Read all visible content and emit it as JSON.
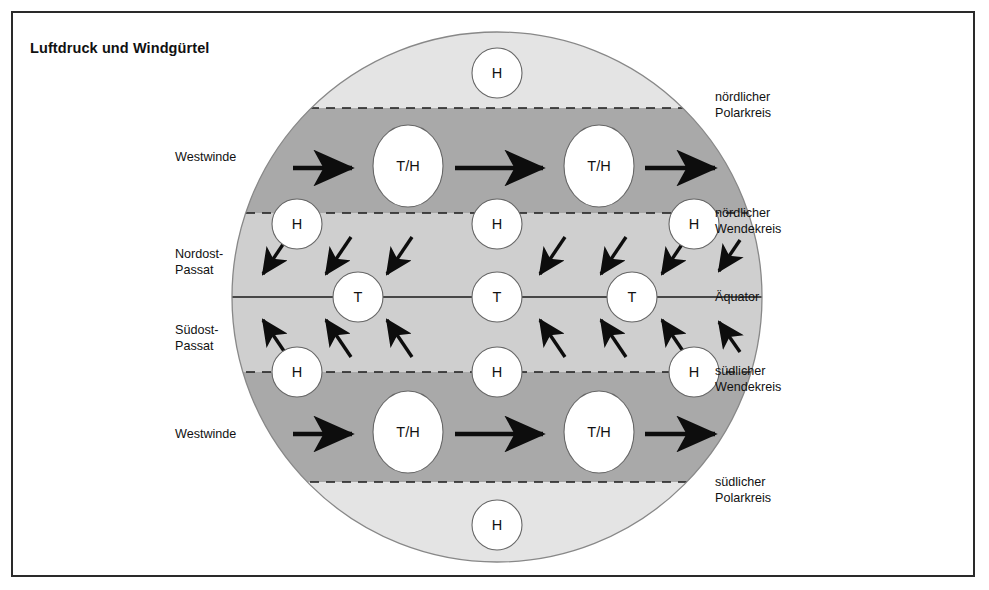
{
  "title": "Luftdruck und Windgürtel",
  "figure": {
    "type": "schematic-diagram",
    "projection": "Kreisscheibe (Globus von der Seite)",
    "geometry": {
      "cx": 497,
      "cy": 297,
      "r": 265
    },
    "colors": {
      "polar_zone": "#e4e4e4",
      "westerly_zone": "#a9a9a9",
      "tropical_zone": "#cfcfcf",
      "cell_fill": "#ffffff",
      "outline": "#555555",
      "line": "#1a1a1a",
      "frame": "#2a2a2a",
      "text": "#111111",
      "background": "#ffffff"
    }
  },
  "boundaries": [
    {
      "id": "noerdlicher-polarkreis",
      "label": "nördlicher\nPolarkreis",
      "label_lines": [
        "nördlicher",
        "Polarkreis"
      ],
      "y": 108,
      "style": "dashed",
      "side": "right"
    },
    {
      "id": "noerdlicher-wendekreis",
      "label": "nördlicher\nWendekreis",
      "label_lines": [
        "nördlicher",
        "Wendekreis"
      ],
      "y": 213,
      "style": "dashed",
      "side": "right"
    },
    {
      "id": "aequator",
      "label": "Äquator",
      "label_lines": [
        "Äquator"
      ],
      "y": 297,
      "style": "solid",
      "side": "right"
    },
    {
      "id": "suedlicher-wendekreis",
      "label": "südlicher\nWendekreis",
      "label_lines": [
        "südlicher",
        "Wendekreis"
      ],
      "y": 372,
      "style": "dashed",
      "side": "right"
    },
    {
      "id": "suedlicher-polarkreis",
      "label": "südlicher\nPolarkreis",
      "label_lines": [
        "südlicher",
        "Polarkreis"
      ],
      "y": 482,
      "style": "dashed",
      "side": "right"
    }
  ],
  "zones": [
    {
      "id": "nordpolarzone",
      "shade": "#e4e4e4",
      "from_y": 31,
      "to_y": 108
    },
    {
      "id": "noerdliche-westwindzone",
      "shade": "#a9a9a9",
      "from_y": 108,
      "to_y": 213
    },
    {
      "id": "tropenzone",
      "shade": "#cfcfcf",
      "from_y": 213,
      "to_y": 372
    },
    {
      "id": "suedliche-westwindzone",
      "shade": "#a9a9a9",
      "from_y": 372,
      "to_y": 482
    },
    {
      "id": "suedpolarzone",
      "shade": "#e4e4e4",
      "from_y": 482,
      "to_y": 563
    }
  ],
  "wind_labels": [
    {
      "id": "westwinde-nord",
      "lines": [
        "Westwinde"
      ],
      "x": 175,
      "y": 150
    },
    {
      "id": "nordost-passat",
      "lines": [
        "Nordost-",
        "Passat"
      ],
      "x": 175,
      "y": 247
    },
    {
      "id": "suedost-passat",
      "lines": [
        "Südost-",
        "Passat"
      ],
      "x": 175,
      "y": 323
    },
    {
      "id": "westwinde-sued",
      "lines": [
        "Westwinde"
      ],
      "x": 175,
      "y": 427
    }
  ],
  "side_labels": [
    {
      "id": "label-noerdlicher-polarkreis",
      "lines": [
        "nördlicher",
        "Polarkreis"
      ],
      "x": 715,
      "y": 90
    },
    {
      "id": "label-noerdlicher-wendekreis",
      "lines": [
        "nördlicher",
        "Wendekreis"
      ],
      "x": 715,
      "y": 206
    },
    {
      "id": "label-aequator",
      "lines": [
        "Äquator"
      ],
      "x": 715,
      "y": 290
    },
    {
      "id": "label-suedlicher-wendekreis",
      "lines": [
        "südlicher",
        "Wendekreis"
      ],
      "x": 715,
      "y": 364
    },
    {
      "id": "label-suedlicher-polarkreis",
      "lines": [
        "südlicher",
        "Polarkreis"
      ],
      "x": 715,
      "y": 475
    }
  ],
  "pressure_cells": [
    {
      "id": "h-nordpol",
      "label": "H",
      "type": "circle",
      "cx": 497,
      "cy": 73,
      "rx": 25,
      "ry": 25,
      "zone": "nordpolarzone"
    },
    {
      "id": "th-nord-1",
      "label": "T/H",
      "type": "ellipse",
      "cx": 408,
      "cy": 166,
      "rx": 35,
      "ry": 41,
      "zone": "noerdliche-westwindzone"
    },
    {
      "id": "th-nord-2",
      "label": "T/H",
      "type": "ellipse",
      "cx": 599,
      "cy": 166,
      "rx": 35,
      "ry": 41,
      "zone": "noerdliche-westwindzone"
    },
    {
      "id": "h-nord-wendekreis-1",
      "label": "H",
      "type": "circle",
      "cx": 297,
      "cy": 224,
      "rx": 25,
      "ry": 25,
      "zone": "noerdlicher-wendekreis"
    },
    {
      "id": "h-nord-wendekreis-2",
      "label": "H",
      "type": "circle",
      "cx": 497,
      "cy": 224,
      "rx": 25,
      "ry": 25,
      "zone": "noerdlicher-wendekreis"
    },
    {
      "id": "h-nord-wendekreis-3",
      "label": "H",
      "type": "circle",
      "cx": 694,
      "cy": 224,
      "rx": 25,
      "ry": 25,
      "zone": "noerdlicher-wendekreis"
    },
    {
      "id": "t-aequator-1",
      "label": "T",
      "type": "circle",
      "cx": 358,
      "cy": 297,
      "rx": 25,
      "ry": 25,
      "zone": "tropenzone"
    },
    {
      "id": "t-aequator-2",
      "label": "T",
      "type": "circle",
      "cx": 497,
      "cy": 297,
      "rx": 25,
      "ry": 25,
      "zone": "tropenzone"
    },
    {
      "id": "t-aequator-3",
      "label": "T",
      "type": "circle",
      "cx": 632,
      "cy": 297,
      "rx": 25,
      "ry": 25,
      "zone": "tropenzone"
    },
    {
      "id": "h-sued-wendekreis-1",
      "label": "H",
      "type": "circle",
      "cx": 297,
      "cy": 372,
      "rx": 25,
      "ry": 25,
      "zone": "suedlicher-wendekreis"
    },
    {
      "id": "h-sued-wendekreis-2",
      "label": "H",
      "type": "circle",
      "cx": 497,
      "cy": 372,
      "rx": 25,
      "ry": 25,
      "zone": "suedlicher-wendekreis"
    },
    {
      "id": "h-sued-wendekreis-3",
      "label": "H",
      "type": "circle",
      "cx": 694,
      "cy": 372,
      "rx": 25,
      "ry": 25,
      "zone": "suedlicher-wendekreis"
    },
    {
      "id": "th-sued-1",
      "label": "T/H",
      "type": "ellipse",
      "cx": 408,
      "cy": 432,
      "rx": 35,
      "ry": 41,
      "zone": "suedliche-westwindzone"
    },
    {
      "id": "th-sued-2",
      "label": "T/H",
      "type": "ellipse",
      "cx": 599,
      "cy": 432,
      "rx": 35,
      "ry": 41,
      "zone": "suedliche-westwindzone"
    },
    {
      "id": "h-suedpol",
      "label": "H",
      "type": "circle",
      "cx": 497,
      "cy": 525,
      "rx": 25,
      "ry": 25,
      "zone": "suedpolarzone"
    }
  ],
  "arrows": {
    "westerly_north": {
      "direction": "nach Osten (West→Ost)",
      "items": [
        {
          "id": "arrow-west-n-1",
          "x1": 293,
          "y1": 168,
          "x2": 355,
          "y2": 168
        },
        {
          "id": "arrow-west-n-2",
          "x1": 455,
          "y1": 168,
          "x2": 546,
          "y2": 168
        },
        {
          "id": "arrow-west-n-3",
          "x1": 645,
          "y1": 168,
          "x2": 718,
          "y2": 168
        }
      ]
    },
    "westerly_south": {
      "direction": "nach Osten (West→Ost)",
      "items": [
        {
          "id": "arrow-west-s-1",
          "x1": 293,
          "y1": 434,
          "x2": 355,
          "y2": 434
        },
        {
          "id": "arrow-west-s-2",
          "x1": 455,
          "y1": 434,
          "x2": 546,
          "y2": 434
        },
        {
          "id": "arrow-west-s-3",
          "x1": 645,
          "y1": 434,
          "x2": 718,
          "y2": 434
        }
      ]
    },
    "northeast_trade": {
      "direction": "von Nordost nach Südwest",
      "items": [
        {
          "id": "arrow-ne-1",
          "x1": 288,
          "y1": 237,
          "x2": 262,
          "y2": 276
        },
        {
          "id": "arrow-ne-2",
          "x1": 351,
          "y1": 237,
          "x2": 325,
          "y2": 276
        },
        {
          "id": "arrow-ne-3",
          "x1": 412,
          "y1": 237,
          "x2": 386,
          "y2": 276
        },
        {
          "id": "arrow-ne-4",
          "x1": 565,
          "y1": 237,
          "x2": 539,
          "y2": 276
        },
        {
          "id": "arrow-ne-5",
          "x1": 626,
          "y1": 237,
          "x2": 600,
          "y2": 276
        },
        {
          "id": "arrow-ne-6",
          "x1": 687,
          "y1": 237,
          "x2": 661,
          "y2": 276
        },
        {
          "id": "arrow-ne-7",
          "x1": 740,
          "y1": 240,
          "x2": 718,
          "y2": 272
        }
      ]
    },
    "southeast_trade": {
      "direction": "von Südost nach Nordwest",
      "items": [
        {
          "id": "arrow-se-1",
          "x1": 288,
          "y1": 357,
          "x2": 262,
          "y2": 318
        },
        {
          "id": "arrow-se-2",
          "x1": 351,
          "y1": 357,
          "x2": 325,
          "y2": 318
        },
        {
          "id": "arrow-se-3",
          "x1": 412,
          "y1": 357,
          "x2": 386,
          "y2": 318
        },
        {
          "id": "arrow-se-4",
          "x1": 565,
          "y1": 357,
          "x2": 539,
          "y2": 318
        },
        {
          "id": "arrow-se-5",
          "x1": 626,
          "y1": 357,
          "x2": 600,
          "y2": 318
        },
        {
          "id": "arrow-se-6",
          "x1": 687,
          "y1": 357,
          "x2": 661,
          "y2": 318
        },
        {
          "id": "arrow-se-7",
          "x1": 740,
          "y1": 352,
          "x2": 718,
          "y2": 320
        }
      ]
    }
  }
}
